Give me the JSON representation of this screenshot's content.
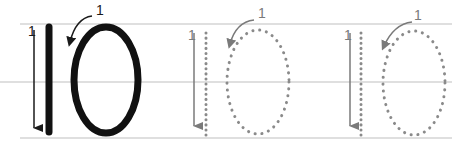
{
  "worksheet": {
    "title": "Tracing number 10",
    "guide_lines": {
      "color": "#cfcfcf",
      "top_y": 24,
      "mid_y": 82,
      "bottom_y": 138
    },
    "examples": [
      {
        "style": "solid",
        "color": "#111111",
        "one_stroke_label": "1",
        "zero_stroke_label": "1"
      },
      {
        "style": "dotted",
        "color": "#8a8a8a",
        "one_stroke_label": "1",
        "zero_stroke_label": "1"
      },
      {
        "style": "dotted",
        "color": "#8a8a8a",
        "one_stroke_label": "1",
        "zero_stroke_label": "1"
      }
    ]
  }
}
